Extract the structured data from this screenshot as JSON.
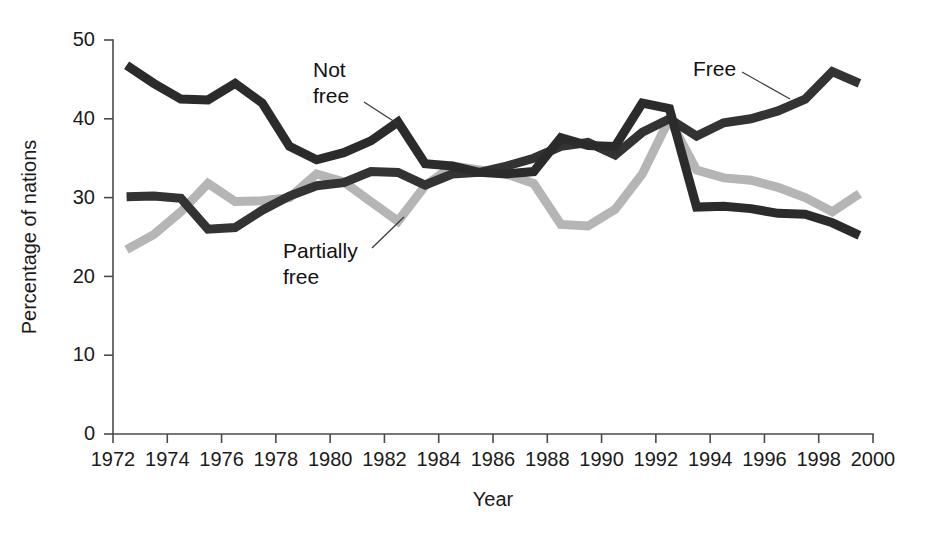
{
  "chart_data": {
    "type": "line",
    "title": "",
    "subtitle": "",
    "xlabel": "Year",
    "ylabel": "Percentage of nations",
    "xlim": [
      1972,
      2000
    ],
    "ylim": [
      0,
      50
    ],
    "xticks": [
      1972,
      1974,
      1976,
      1978,
      1980,
      1982,
      1984,
      1986,
      1988,
      1990,
      1992,
      1994,
      1996,
      1998,
      2000
    ],
    "yticks": [
      0,
      10,
      20,
      30,
      40,
      50
    ],
    "grid": false,
    "legend_position": "inline-annotations",
    "x": [
      1972.5,
      1973.5,
      1974.5,
      1975.5,
      1976.5,
      1977.5,
      1978.5,
      1979.5,
      1980.5,
      1981.5,
      1982.5,
      1983.5,
      1984.5,
      1985.5,
      1986.5,
      1987.5,
      1988.5,
      1989.5,
      1990.5,
      1991.5,
      1992.5,
      1993.5,
      1994.5,
      1995.5,
      1996.5,
      1997.5,
      1998.5,
      1999.5
    ],
    "series": [
      {
        "name": "Not free",
        "color": "#2b2b2b",
        "values": [
          46.8,
          44.5,
          42.5,
          42.4,
          44.5,
          42.0,
          36.5,
          34.8,
          35.7,
          37.2,
          39.6,
          34.3,
          34.0,
          33.2,
          33.0,
          33.3,
          37.6,
          36.6,
          36.5,
          42.0,
          41.3,
          28.8,
          28.9,
          28.6,
          28.0,
          27.9,
          26.8,
          25.2
        ]
      },
      {
        "name": "Free",
        "color": "#333333",
        "values": [
          30.1,
          30.2,
          29.9,
          26.0,
          26.2,
          28.4,
          30.2,
          31.5,
          31.9,
          33.3,
          33.2,
          31.6,
          33.0,
          33.2,
          34.0,
          35.0,
          36.5,
          37.0,
          35.4,
          38.3,
          40.0,
          37.8,
          39.5,
          40.0,
          41.0,
          42.5,
          46.0,
          44.5
        ]
      },
      {
        "name": "Partially free",
        "color": "#b5b5b5",
        "values": [
          23.4,
          25.3,
          28.2,
          31.8,
          29.5,
          29.6,
          30.0,
          33.0,
          32.0,
          29.5,
          27.0,
          31.5,
          34.0,
          33.5,
          33.0,
          31.8,
          26.6,
          26.4,
          28.5,
          33.0,
          40.0,
          33.5,
          32.5,
          32.2,
          31.3,
          30.0,
          28.2,
          30.5
        ]
      }
    ],
    "annotations": [
      {
        "label_line1": "Not",
        "label_line2": "free",
        "points_to_series": "Not free",
        "points_to_year": 1982.5
      },
      {
        "label_line1": "Free",
        "label_line2": "",
        "points_to_series": "Free",
        "points_to_year": 1997.0
      },
      {
        "label_line1": "Partially",
        "label_line2": "free",
        "points_to_series": "Partially free",
        "points_to_year": 1982.8
      }
    ]
  },
  "annotation_text": {
    "not_free_l1": "Not",
    "not_free_l2": "free",
    "free_l1": "Free",
    "partially_free_l1": "Partially",
    "partially_free_l2": "free"
  },
  "axis": {
    "y_title": "Percentage of nations",
    "x_title": "Year",
    "y_tick_0": "0",
    "y_tick_10": "10",
    "y_tick_20": "20",
    "y_tick_30": "30",
    "y_tick_40": "40",
    "y_tick_50": "50",
    "x_tick_1972": "1972",
    "x_tick_1974": "1974",
    "x_tick_1976": "1976",
    "x_tick_1978": "1978",
    "x_tick_1980": "1980",
    "x_tick_1982": "1982",
    "x_tick_1984": "1984",
    "x_tick_1986": "1986",
    "x_tick_1988": "1988",
    "x_tick_1990": "1990",
    "x_tick_1992": "1992",
    "x_tick_1994": "1994",
    "x_tick_1996": "1996",
    "x_tick_1998": "1998",
    "x_tick_2000": "2000"
  },
  "colors": {
    "not_free": "#2b2b2b",
    "free": "#333333",
    "partially_free": "#b5b5b5",
    "axis": "#4a4a4a",
    "text": "#1a1a1a",
    "background": "#ffffff"
  }
}
